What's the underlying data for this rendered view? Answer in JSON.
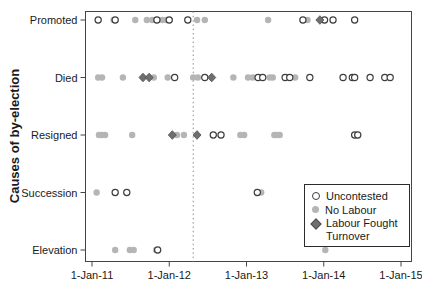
{
  "chart_data": {
    "type": "scatter",
    "title": "",
    "ylabel": "Causes of by-election",
    "categories": [
      "Promoted",
      "Died",
      "Resigned",
      "Succession",
      "Elevation"
    ],
    "x_tick_labels": [
      "1-Jan-11",
      "1-Jan-12",
      "1-Jan-13",
      "1-Jan-14",
      "1-Jan-15"
    ],
    "x_range_years": [
      2011,
      2015
    ],
    "grid": false,
    "reference_line": {
      "year": 2012.31,
      "style": "dotted"
    },
    "legend": {
      "position": "inside-bottom-right",
      "items": [
        {
          "label": "Uncontested",
          "marker": "open-circle"
        },
        {
          "label": "No Labour",
          "marker": "gray-filled-circle"
        },
        {
          "label": "Labour Fought Turnover",
          "marker": "dark-filled-diamond"
        }
      ]
    },
    "series": [
      {
        "name": "No Labour",
        "marker": "gray-filled-circle",
        "points": [
          {
            "category": "Promoted",
            "year": 2011.28
          },
          {
            "category": "Promoted",
            "year": 2011.56
          },
          {
            "category": "Promoted",
            "year": 2011.71
          },
          {
            "category": "Promoted",
            "year": 2011.78
          },
          {
            "category": "Promoted",
            "year": 2011.91
          },
          {
            "category": "Promoted",
            "year": 2011.96
          },
          {
            "category": "Promoted",
            "year": 2012.36
          },
          {
            "category": "Promoted",
            "year": 2012.46
          },
          {
            "category": "Promoted",
            "year": 2013.28
          },
          {
            "category": "Promoted",
            "year": 2013.79
          },
          {
            "category": "Died",
            "year": 2011.08
          },
          {
            "category": "Died",
            "year": 2011.13
          },
          {
            "category": "Died",
            "year": 2011.4
          },
          {
            "category": "Died",
            "year": 2011.8
          },
          {
            "category": "Died",
            "year": 2011.98
          },
          {
            "category": "Died",
            "year": 2012.31
          },
          {
            "category": "Died",
            "year": 2012.37
          },
          {
            "category": "Died",
            "year": 2012.83
          },
          {
            "category": "Died",
            "year": 2013.02
          },
          {
            "category": "Died",
            "year": 2013.08
          },
          {
            "category": "Died",
            "year": 2013.3
          },
          {
            "category": "Died",
            "year": 2013.34
          },
          {
            "category": "Died",
            "year": 2013.63
          },
          {
            "category": "Resigned",
            "year": 2011.09
          },
          {
            "category": "Resigned",
            "year": 2011.13
          },
          {
            "category": "Resigned",
            "year": 2011.17
          },
          {
            "category": "Resigned",
            "year": 2011.52
          },
          {
            "category": "Resigned",
            "year": 2012.1
          },
          {
            "category": "Resigned",
            "year": 2012.19
          },
          {
            "category": "Resigned",
            "year": 2012.92
          },
          {
            "category": "Resigned",
            "year": 2012.97
          },
          {
            "category": "Resigned",
            "year": 2013.36
          },
          {
            "category": "Resigned",
            "year": 2013.39
          },
          {
            "category": "Resigned",
            "year": 2013.43
          },
          {
            "category": "Succession",
            "year": 2011.06
          },
          {
            "category": "Succession",
            "year": 2013.19
          },
          {
            "category": "Elevation",
            "year": 2011.3
          },
          {
            "category": "Elevation",
            "year": 2011.49
          },
          {
            "category": "Elevation",
            "year": 2011.54
          },
          {
            "category": "Elevation",
            "year": 2011.83
          },
          {
            "category": "Elevation",
            "year": 2014.02
          }
        ]
      },
      {
        "name": "Uncontested",
        "marker": "open-circle",
        "points": [
          {
            "category": "Promoted",
            "year": 2011.08
          },
          {
            "category": "Promoted",
            "year": 2011.3
          },
          {
            "category": "Promoted",
            "year": 2011.84
          },
          {
            "category": "Promoted",
            "year": 2012.0
          },
          {
            "category": "Promoted",
            "year": 2012.24
          },
          {
            "category": "Promoted",
            "year": 2013.73
          },
          {
            "category": "Promoted",
            "year": 2014.01
          },
          {
            "category": "Promoted",
            "year": 2014.12
          },
          {
            "category": "Promoted",
            "year": 2014.4
          },
          {
            "category": "Died",
            "year": 2012.07
          },
          {
            "category": "Died",
            "year": 2012.46
          },
          {
            "category": "Died",
            "year": 2013.15
          },
          {
            "category": "Died",
            "year": 2013.21
          },
          {
            "category": "Died",
            "year": 2013.5
          },
          {
            "category": "Died",
            "year": 2013.56
          },
          {
            "category": "Died",
            "year": 2013.82
          },
          {
            "category": "Died",
            "year": 2014.25
          },
          {
            "category": "Died",
            "year": 2014.37
          },
          {
            "category": "Died",
            "year": 2014.4
          },
          {
            "category": "Died",
            "year": 2014.6
          },
          {
            "category": "Died",
            "year": 2014.79
          },
          {
            "category": "Died",
            "year": 2014.86
          },
          {
            "category": "Resigned",
            "year": 2012.57
          },
          {
            "category": "Resigned",
            "year": 2012.67
          },
          {
            "category": "Resigned",
            "year": 2014.4
          },
          {
            "category": "Resigned",
            "year": 2014.44
          },
          {
            "category": "Succession",
            "year": 2011.3
          },
          {
            "category": "Succession",
            "year": 2011.45
          },
          {
            "category": "Succession",
            "year": 2013.14
          },
          {
            "category": "Elevation",
            "year": 2011.85
          }
        ]
      },
      {
        "name": "Labour Fought Turnover",
        "marker": "dark-filled-diamond",
        "points": [
          {
            "category": "Promoted",
            "year": 2013.95
          },
          {
            "category": "Died",
            "year": 2011.66
          },
          {
            "category": "Died",
            "year": 2011.74
          },
          {
            "category": "Died",
            "year": 2012.55
          },
          {
            "category": "Resigned",
            "year": 2012.04
          },
          {
            "category": "Resigned",
            "year": 2012.36
          }
        ]
      }
    ]
  },
  "colors": {
    "open_circle_stroke": "#3d3d3d",
    "gray_fill": "#b5b5b5",
    "diamond_fill": "#6f6f6f",
    "diamond_stroke": "#4d4d4d",
    "axis": "#454545",
    "reference_line": "#8f8f8f",
    "text": "#1a1a1a",
    "legend_border": "#2b2b2b",
    "background": "#ffffff"
  }
}
